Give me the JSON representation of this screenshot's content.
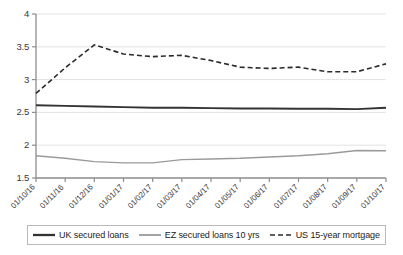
{
  "chart_data": {
    "type": "line",
    "title": "",
    "xlabel": "",
    "ylabel": "",
    "ylim": [
      1.5,
      4
    ],
    "yticks": [
      1.5,
      2,
      2.5,
      3,
      3.5,
      4
    ],
    "ytick_labels": [
      "1.5",
      "2",
      "2.5",
      "3",
      "3.5",
      "4"
    ],
    "grid": true,
    "grid_axis": "y",
    "legend_position": "bottom",
    "categories": [
      "01/10/16",
      "01/11/16",
      "01/12/16",
      "01/01/17",
      "01/02/17",
      "01/03/17",
      "01/04/17",
      "01/05/17",
      "01/06/17",
      "01/07/17",
      "01/08/17",
      "01/09/17",
      "01/10/17"
    ],
    "series": [
      {
        "name": "UK secured loans",
        "color": "#333333",
        "style": "solid",
        "width": 1.9,
        "values": [
          2.61,
          2.6,
          2.59,
          2.58,
          2.57,
          2.57,
          2.565,
          2.56,
          2.56,
          2.555,
          2.555,
          2.55,
          2.57
        ]
      },
      {
        "name": "EZ secured loans 10 yrs",
        "color": "#9a9a9a",
        "style": "solid",
        "width": 1.4,
        "values": [
          1.84,
          1.8,
          1.75,
          1.73,
          1.73,
          1.78,
          1.79,
          1.8,
          1.82,
          1.84,
          1.87,
          1.92,
          1.915
        ]
      },
      {
        "name": "US 15-year mortgage",
        "color": "#2b2b2b",
        "style": "dashed",
        "width": 1.6,
        "values": [
          2.79,
          3.18,
          3.53,
          3.39,
          3.35,
          3.37,
          3.29,
          3.19,
          3.17,
          3.19,
          3.12,
          3.12,
          3.24
        ]
      }
    ]
  },
  "legend": {
    "items": [
      {
        "label": "UK secured loans",
        "swatch": "solid-dark-line-icon"
      },
      {
        "label": "EZ secured loans 10 yrs",
        "swatch": "solid-gray-line-icon"
      },
      {
        "label": "US 15-year mortgage",
        "swatch": "dashed-dark-line-icon"
      }
    ]
  }
}
